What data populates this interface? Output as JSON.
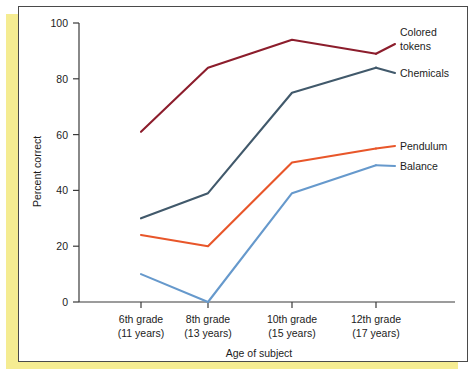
{
  "chart_data": {
    "type": "line",
    "title": "",
    "xlabel": "Age of subject",
    "ylabel": "Percent correct",
    "categories": [
      "6th grade\n(11 years)",
      "8th grade\n(13 years)",
      "10th grade\n(15 years)",
      "12th grade\n(17 years)"
    ],
    "category_lines": [
      {
        "top": "6th grade",
        "bottom": "(11 years)"
      },
      {
        "top": "8th grade",
        "bottom": "(13 years)"
      },
      {
        "top": "10th grade",
        "bottom": "(15 years)"
      },
      {
        "top": "12th grade",
        "bottom": "(17 years)"
      }
    ],
    "ylim": [
      0,
      100
    ],
    "yticks": [
      0,
      20,
      40,
      60,
      80,
      100
    ],
    "ytick_labels": [
      "0",
      "20",
      "40",
      "60",
      "80",
      "100"
    ],
    "grid": false,
    "legend_position": "right-inline-labels",
    "series": [
      {
        "name": "Colored tokens",
        "label_line1": "Colored",
        "label_line2": "tokens",
        "color": "#8c1d2c",
        "values": [
          61,
          84,
          94,
          89
        ]
      },
      {
        "name": "Chemicals",
        "label_line1": "Chemicals",
        "label_line2": "",
        "color": "#41596b",
        "values": [
          30,
          39,
          75,
          84
        ]
      },
      {
        "name": "Pendulum",
        "label_line1": "Pendulum",
        "label_line2": "",
        "color": "#e8562a",
        "values": [
          24,
          20,
          50,
          55
        ]
      },
      {
        "name": "Balance",
        "label_line1": "Balance",
        "label_line2": "",
        "color": "#6699cc",
        "values": [
          10,
          0,
          39,
          49
        ]
      }
    ]
  },
  "figure": {
    "panel_background": "#ffffff",
    "backing_color": "#f5ec92",
    "frame_color": "#4a4a4a"
  }
}
